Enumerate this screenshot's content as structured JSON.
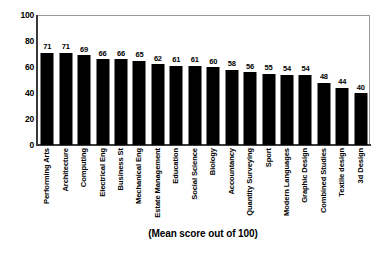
{
  "chart_data": {
    "type": "bar",
    "title": "",
    "subtitle": "",
    "xlabel": "(Mean score out of 100)",
    "ylabel": "",
    "ylim": [
      0,
      100
    ],
    "yticks": [
      0,
      20,
      40,
      60,
      80,
      100
    ],
    "grid": false,
    "legend": null,
    "bar_color": "#000000",
    "categories": [
      "Performing Arts",
      "Architecture",
      "Computing",
      "Electrical Eng",
      "Business St",
      "Mechanical Eng",
      "Estate Management",
      "Education",
      "Social Science",
      "Biology",
      "Accountancy",
      "Quantity Surveying",
      "Sport",
      "Modern Languages",
      "Graphic Design",
      "Combined Studies",
      "Textile design",
      "3d Design"
    ],
    "values": [
      71,
      71,
      69,
      66,
      66,
      65,
      62,
      61,
      61,
      60,
      58,
      56,
      55,
      54,
      54,
      48,
      44,
      40
    ],
    "value_labels": [
      "71",
      "71",
      "69",
      "66",
      "66",
      "65",
      "62",
      "61",
      "61",
      "60",
      "58",
      "56",
      "55",
      "54",
      "54",
      "48",
      "44",
      "40"
    ],
    "ytick_labels": [
      "0",
      "20",
      "40",
      "60",
      "80",
      "100"
    ]
  },
  "caption": {
    "text": "(Mean score out of 100)"
  }
}
